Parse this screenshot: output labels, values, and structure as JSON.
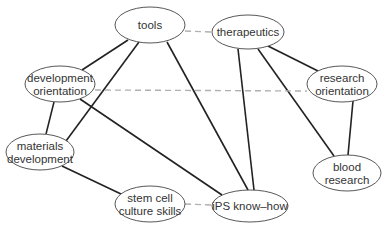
{
  "diagram": {
    "type": "network",
    "nodes": [
      {
        "id": "tools",
        "lines": [
          "tools"
        ],
        "cx": 150,
        "cy": 25,
        "rx": 35,
        "ry": 18
      },
      {
        "id": "therapeutics",
        "lines": [
          "therapeutics"
        ],
        "cx": 248,
        "cy": 32,
        "rx": 36,
        "ry": 17
      },
      {
        "id": "development-orientation",
        "lines": [
          "development",
          "orientation"
        ],
        "cx": 60,
        "cy": 84,
        "rx": 35,
        "ry": 18
      },
      {
        "id": "research-orientation",
        "lines": [
          "research",
          "orientation"
        ],
        "cx": 342,
        "cy": 84,
        "rx": 35,
        "ry": 18
      },
      {
        "id": "materials-development",
        "lines": [
          "materials",
          "development"
        ],
        "cx": 40,
        "cy": 152,
        "rx": 34,
        "ry": 18
      },
      {
        "id": "blood-research",
        "lines": [
          "blood",
          "research"
        ],
        "cx": 347,
        "cy": 173,
        "rx": 34,
        "ry": 18
      },
      {
        "id": "stem-cell-culture-skills",
        "lines": [
          "stem cell",
          "culture skills"
        ],
        "cx": 150,
        "cy": 204,
        "rx": 35,
        "ry": 18
      },
      {
        "id": "ips-know-how",
        "lines": [
          "iPS know–how"
        ],
        "cx": 250,
        "cy": 206,
        "rx": 38,
        "ry": 16
      }
    ],
    "edges": [
      {
        "from": "tools",
        "to": "development-orientation",
        "style": "solid",
        "x1": 128,
        "y1": 40,
        "x2": 82,
        "y2": 70
      },
      {
        "from": "tools",
        "to": "materials-development",
        "style": "solid",
        "x1": 139,
        "y1": 42,
        "x2": 66,
        "y2": 141
      },
      {
        "from": "tools",
        "to": "ips-know-how",
        "style": "solid",
        "x1": 167,
        "y1": 42,
        "x2": 248,
        "y2": 190
      },
      {
        "from": "tools",
        "to": "therapeutics",
        "style": "dashed",
        "x1": 185,
        "y1": 31,
        "x2": 212,
        "y2": 32
      },
      {
        "from": "therapeutics",
        "to": "ips-know-how",
        "style": "solid",
        "x1": 238,
        "y1": 49,
        "x2": 254,
        "y2": 190
      },
      {
        "from": "therapeutics",
        "to": "research-orientation",
        "style": "solid",
        "x1": 268,
        "y1": 46,
        "x2": 318,
        "y2": 71
      },
      {
        "from": "therapeutics",
        "to": "blood-research",
        "style": "solid",
        "x1": 258,
        "y1": 49,
        "x2": 334,
        "y2": 156
      },
      {
        "from": "development-orientation",
        "to": "research-orientation",
        "style": "dashed",
        "x1": 95,
        "y1": 90,
        "x2": 307,
        "y2": 91
      },
      {
        "from": "development-orientation",
        "to": "materials-development",
        "style": "solid",
        "x1": 54,
        "y1": 102,
        "x2": 46,
        "y2": 134
      },
      {
        "from": "development-orientation",
        "to": "ips-know-how",
        "style": "solid",
        "x1": 80,
        "y1": 99,
        "x2": 222,
        "y2": 195
      },
      {
        "from": "research-orientation",
        "to": "blood-research",
        "style": "solid",
        "x1": 353,
        "y1": 101,
        "x2": 348,
        "y2": 155
      },
      {
        "from": "materials-development",
        "to": "stem-cell-culture-skills",
        "style": "solid",
        "x1": 62,
        "y1": 166,
        "x2": 121,
        "y2": 194
      },
      {
        "from": "stem-cell-culture-skills",
        "to": "ips-know-how",
        "style": "dashed",
        "x1": 185,
        "y1": 204,
        "x2": 212,
        "y2": 205
      }
    ]
  },
  "colors": {
    "background": "#ffffff",
    "node_stroke": "#444444",
    "solid_edge": "#222222",
    "dashed_edge": "#b0b0b0",
    "text": "#333333"
  }
}
